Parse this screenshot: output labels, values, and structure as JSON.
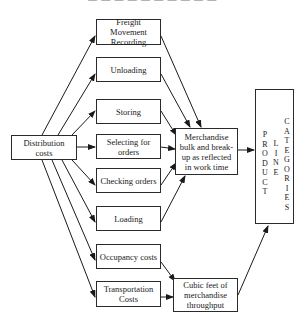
{
  "header": {
    "text": "— — — — —   — — — — —"
  },
  "diagram": {
    "source": {
      "label": "Distribution costs"
    },
    "activities": [
      {
        "label": "Freight Movement Recording"
      },
      {
        "label": "Unloading"
      },
      {
        "label": "Storing"
      },
      {
        "label": "Selecting for orders"
      },
      {
        "label": "Checking orders"
      },
      {
        "label": "Loading"
      },
      {
        "label": "Occupancy costs"
      },
      {
        "label": "Transportation Costs"
      }
    ],
    "drivers": [
      {
        "label": "Merchandise bulk and break-up as reflected in work time"
      },
      {
        "label": "Cubic feet of merchandise throughput"
      }
    ],
    "target": {
      "label": "PRODUCT LINE CATEGORIES",
      "col1": [
        "P",
        "R",
        "O",
        "D",
        "U",
        "C",
        "T"
      ],
      "col2": [
        "L",
        "I",
        "N",
        "E"
      ],
      "col3": [
        "C",
        "A",
        "T",
        "E",
        "G",
        "O",
        "R",
        "I",
        "E",
        "S"
      ]
    }
  }
}
